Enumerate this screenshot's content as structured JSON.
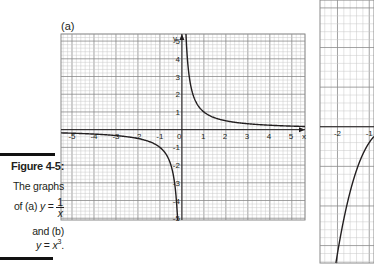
{
  "figure": {
    "panel_a_label": "(a)",
    "caption": {
      "title": "Figure 4-5:",
      "line1": "The graphs",
      "line2_prefix": "of (a) ",
      "line2_var": "y",
      "line2_eq": " = ",
      "frac_num": "1",
      "frac_den": "x",
      "line3": "and (b)",
      "line4_var": "y",
      "line4_eq": " = ",
      "line4_base": "x",
      "line4_exp": "3",
      "line4_end": "."
    },
    "colors": {
      "curve": "#231f20",
      "axis": "#231f20",
      "grid_major": "#8a8a8a",
      "grid_minor": "#c8c8c8",
      "caption_bar": "#111111"
    }
  },
  "chart_data": [
    {
      "type": "line",
      "title": "(a)",
      "function": "y = 1/x",
      "xlabel": "x",
      "ylabel": "y",
      "xlim": [
        -5.5,
        5.6
      ],
      "ylim": [
        -5.1,
        5.4
      ],
      "xticks": [
        -5,
        -4,
        -3,
        -2,
        -1,
        0,
        1,
        2,
        3,
        4,
        5
      ],
      "yticks": [
        -5,
        -4,
        -3,
        -2,
        -1,
        1,
        2,
        3,
        4,
        5
      ],
      "xtick_labels": [
        "-5",
        "-4",
        "-3",
        "-2",
        "-1",
        "0",
        "1",
        "2",
        "3",
        "4",
        "5"
      ],
      "ytick_labels": [
        "-5",
        "-4",
        "-3",
        "-2",
        "-1",
        "1",
        "2",
        "3",
        "4",
        "5"
      ],
      "grid": true,
      "minor_per_unit": 5,
      "series": [
        {
          "name": "y=1/x (x<0)",
          "x_range": [
            -5.5,
            -0.19
          ]
        },
        {
          "name": "y=1/x (x>0)",
          "x_range": [
            0.185,
            5.6
          ]
        }
      ]
    },
    {
      "type": "line",
      "title": "(b)",
      "function": "y = x^3",
      "partial": true,
      "xlim": [
        -2.55,
        -0.85
      ],
      "ylim": [
        -8.6,
        8.0
      ],
      "xticks": [
        -2,
        -1
      ],
      "xtick_labels": [
        "-2",
        "-1"
      ],
      "grid": true,
      "minor_per_unit": 5,
      "series": [
        {
          "name": "y=x^3",
          "x_range": [
            -2.05,
            -0.85
          ]
        }
      ]
    }
  ]
}
